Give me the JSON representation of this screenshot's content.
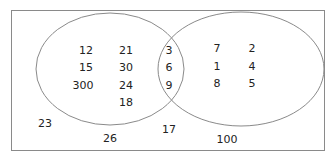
{
  "diagram": {
    "type": "venn",
    "universal_set": {
      "outside": [
        "23",
        "26",
        "17",
        "100"
      ]
    },
    "set_a_only": [
      "12",
      "21",
      "15",
      "30",
      "300",
      "24",
      "18"
    ],
    "intersection": [
      "3",
      "6",
      "9"
    ],
    "set_b_only": [
      "7",
      "2",
      "1",
      "4",
      "8",
      "5"
    ]
  },
  "labels": {
    "a1": "12",
    "a2": "21",
    "a3": "15",
    "a4": "30",
    "a5": "300",
    "a6": "24",
    "a7": "18",
    "i1": "3",
    "i2": "6",
    "i3": "9",
    "b1": "7",
    "b2": "2",
    "b3": "1",
    "b4": "4",
    "b5": "8",
    "b6": "5",
    "o1": "23",
    "o2": "26",
    "o3": "17",
    "o4": "100"
  },
  "colors": {
    "stroke": "#8a8a8a",
    "text": "#222222"
  }
}
